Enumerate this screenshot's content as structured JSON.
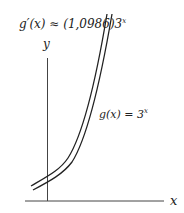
{
  "diagram": {
    "title": "",
    "derivative_label": {
      "prefix": "g′(x) ≈ (1,0986)3",
      "exponent": "x"
    },
    "function_label": {
      "prefix": "g(x) = 3",
      "exponent": "x"
    },
    "axes": {
      "x_label": "x",
      "y_label": "y"
    },
    "colors": {
      "line": "#222222",
      "background": "#ffffff"
    },
    "curves": [
      {
        "name": "g(x) = 3^x",
        "style": "double-line"
      }
    ]
  }
}
